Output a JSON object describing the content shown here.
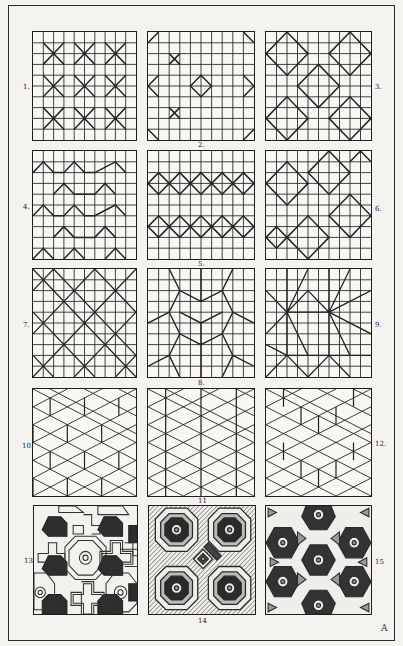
{
  "plate": {
    "tiles": [
      {
        "number": "1.",
        "pattern": "grid-with-octagon-crosses"
      },
      {
        "number": "2.",
        "pattern": "grid-with-sparse-diagonals"
      },
      {
        "number": "3.",
        "pattern": "grid-with-diamonds"
      },
      {
        "number": "4.",
        "pattern": "grid-with-zigzag-chevrons"
      },
      {
        "number": "5.",
        "pattern": "grid-with-diamond-chains"
      },
      {
        "number": "6.",
        "pattern": "grid-with-dense-diamonds"
      },
      {
        "number": "7.",
        "pattern": "grid-with-diagonal-lattice"
      },
      {
        "number": "8.",
        "pattern": "grid-with-star-polygons"
      },
      {
        "number": "9.",
        "pattern": "grid-with-radiating-stars"
      },
      {
        "number": "10.",
        "pattern": "hexagonal-cube-lattice"
      },
      {
        "number": "11",
        "pattern": "triangular-lattice"
      },
      {
        "number": "12.",
        "pattern": "hexagonal-lattice"
      },
      {
        "number": "13",
        "pattern": "shaded-octagons-and-crosses"
      },
      {
        "number": "14",
        "pattern": "shaded-octagons-with-diamond"
      },
      {
        "number": "15",
        "pattern": "shaded-hexagons-and-triangles"
      }
    ],
    "signature": "A"
  }
}
